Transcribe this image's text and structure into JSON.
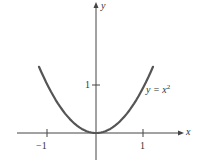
{
  "chart_data": {
    "type": "line",
    "title": "",
    "xlabel": "x",
    "ylabel": "y",
    "xticks": [
      {
        "value": -1,
        "label": "−1"
      },
      {
        "value": 1,
        "label": "1"
      }
    ],
    "yticks": [
      {
        "value": 1,
        "label": "1"
      }
    ],
    "xlim": [
      -1.6,
      1.8
    ],
    "ylim": [
      -0.55,
      2.75
    ],
    "grid": false,
    "series": [
      {
        "name": "y = x^2",
        "color": "#555555",
        "x": [
          -1.2,
          -1.0,
          -0.8,
          -0.6,
          -0.4,
          -0.2,
          0,
          0.2,
          0.4,
          0.6,
          0.8,
          1.0,
          1.2
        ],
        "y": [
          1.44,
          1.0,
          0.64,
          0.36,
          0.16,
          0.04,
          0,
          0.04,
          0.16,
          0.36,
          0.64,
          1.0,
          1.44
        ]
      }
    ],
    "annotations": [
      {
        "text": "y = x^2",
        "near_x": 1.1,
        "near_y": 1.0
      }
    ]
  },
  "labels": {
    "x_axis": "x",
    "y_axis": "y",
    "tick_neg1": "−1",
    "tick_pos1": "1",
    "tick_y1": "1",
    "curve_y": "y",
    "curve_eq": " = x",
    "curve_exp": "2"
  }
}
